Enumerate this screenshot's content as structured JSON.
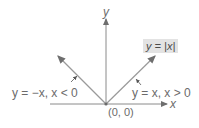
{
  "diagram": {
    "title_box": "y = |x|",
    "axes": {
      "x_label": "x",
      "y_label": "y"
    },
    "origin_label": "(0, 0)",
    "branches": [
      {
        "label": "y = −x, x < 0",
        "direction": "up-left"
      },
      {
        "label": "y = x, x > 0",
        "direction": "up-right"
      }
    ],
    "colors": {
      "line": "#9a9a9a",
      "axis": "#8a8a8a",
      "box_bg": "#e3e3e3",
      "text": "#6b6b6b"
    }
  }
}
